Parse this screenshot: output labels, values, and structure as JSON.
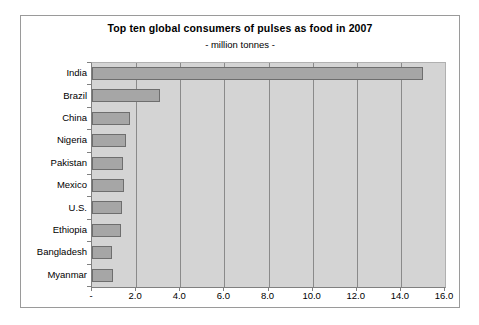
{
  "chart_data": {
    "type": "bar",
    "orientation": "horizontal",
    "title": "Top ten global consumers of pulses as food in 2007",
    "subtitle": "- million tonnes -",
    "xlabel": "",
    "ylabel": "",
    "categories": [
      "India",
      "Brazil",
      "China",
      "Nigeria",
      "Pakistan",
      "Mexico",
      "U.S.",
      "Ethiopia",
      "Bangladesh",
      "Myanmar"
    ],
    "values": [
      15.0,
      3.1,
      1.7,
      1.55,
      1.4,
      1.45,
      1.35,
      1.3,
      0.9,
      0.95
    ],
    "series": [
      {
        "name": "Consumption",
        "values": [
          15.0,
          3.1,
          1.7,
          1.55,
          1.4,
          1.45,
          1.35,
          1.3,
          0.9,
          0.95
        ]
      }
    ],
    "xlim": [
      0,
      16
    ],
    "xticks": [
      0,
      2,
      4,
      6,
      8,
      10,
      12,
      14,
      16
    ],
    "xtick_labels": [
      "-",
      "2.0",
      "4.0",
      "6.0",
      "8.0",
      "10.0",
      "12.0",
      "14.0",
      "16.0"
    ],
    "grid": true,
    "grid_axis": "x",
    "legend": false,
    "legend_position": "none",
    "plot_background": "#d4d4d4",
    "bar_fill": "#a6a6a6",
    "bar_border": "#6e6e6e",
    "gridline_color": "#8a8a8a",
    "frame_color": "#9a9a9a",
    "text_color": "#000000",
    "page_background": "#ffffff"
  }
}
